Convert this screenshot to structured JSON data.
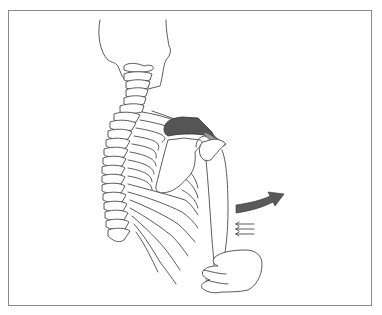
{
  "figure": {
    "colors": {
      "frame": "#8a8a8a",
      "line": "#4a4a4a",
      "muscle_fill": "#555555",
      "muscle_highlight": "#9a9a9a",
      "arrow_fill": "#5a5a5a",
      "background": "#ffffff"
    },
    "elements": {
      "skull": "skull-outline",
      "cervical_spine": "cervical-vertebrae",
      "thoracic_spine": "thoracic-vertebrae",
      "ribs": "rib-cage",
      "scapula": "scapula",
      "muscle": "highlighted-supraspinatus",
      "humerus": "humerus-arm",
      "hand": "hand",
      "abduction_arrow": "curved-arrow-right",
      "force_arrows": "small-arrows-left"
    },
    "force_arrow_count": 3
  }
}
